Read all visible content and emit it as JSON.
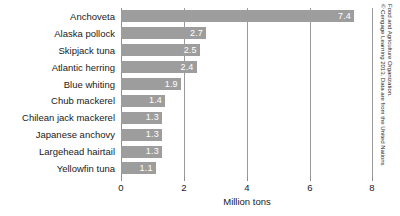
{
  "chart_data": {
    "type": "bar",
    "orientation": "horizontal",
    "title": "",
    "subtitle": "",
    "xlabel": "Million tons",
    "ylabel": "",
    "xlim": [
      0,
      8
    ],
    "xticks": [
      0,
      2,
      4,
      6,
      8
    ],
    "xtick_labels": [
      "0",
      "2",
      "4",
      "6",
      "8"
    ],
    "grid": true,
    "grid_axis": "x",
    "legend": false,
    "bar_color": "#9d9d9d",
    "value_label_color": "#ffffff",
    "categories": [
      "Anchoveta",
      "Alaska pollock",
      "Skipjack tuna",
      "Atlantic herring",
      "Blue whiting",
      "Chub mackerel",
      "Chilean jack mackerel",
      "Japanese anchovy",
      "Largehead hairtail",
      "Yellowfin tuna"
    ],
    "values": [
      7.4,
      2.7,
      2.5,
      2.4,
      1.9,
      1.4,
      1.3,
      1.3,
      1.3,
      1.1
    ],
    "value_labels": [
      "7.4",
      "2.7",
      "2.5",
      "2.4",
      "1.9",
      "1.4",
      "1.3",
      "1.3",
      "1.3",
      "1.1"
    ]
  },
  "credit": {
    "line1": "© Cengage Learning 2013. Data are from the United Nations",
    "line2": "Food and Agriculture Organization."
  }
}
